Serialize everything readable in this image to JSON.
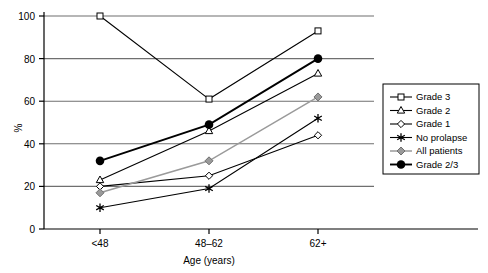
{
  "chart_data": {
    "type": "line",
    "title": "",
    "xlabel": "Age  (years)",
    "ylabel": "%",
    "categories": [
      "<48",
      "48–62",
      "62+"
    ],
    "ylim": [
      0,
      100
    ],
    "yticks": [
      0,
      20,
      40,
      60,
      80,
      100
    ],
    "grid": true,
    "legend_position": "right",
    "series": [
      {
        "name": "Grade 3",
        "values": [
          100,
          61,
          93
        ],
        "marker": "open-square",
        "color": "#000000",
        "marker_fill": "#ffffff"
      },
      {
        "name": "Grade 2",
        "values": [
          23,
          46,
          73
        ],
        "marker": "open-triangle",
        "color": "#000000",
        "marker_fill": "#ffffff"
      },
      {
        "name": "Grade 1",
        "values": [
          20,
          25,
          44
        ],
        "marker": "open-diamond",
        "color": "#000000",
        "marker_fill": "#ffffff"
      },
      {
        "name": "No prolapse",
        "values": [
          10,
          19,
          52
        ],
        "marker": "star",
        "color": "#000000",
        "marker_fill": "#000000"
      },
      {
        "name": "All patients",
        "values": [
          17,
          32,
          62
        ],
        "marker": "gray-diamond",
        "color": "#9a9a9a",
        "marker_fill": "#9a9a9a"
      },
      {
        "name": "Grade 2/3",
        "values": [
          32,
          49,
          80
        ],
        "marker": "filled-circle",
        "color": "#000000",
        "marker_fill": "#000000"
      }
    ]
  },
  "axes": {
    "y_tick_labels": [
      "0",
      "20",
      "40",
      "60",
      "80",
      "100"
    ],
    "x_tick_labels": [
      "<48",
      "48–62",
      "62+"
    ],
    "y_axis_label": "%",
    "x_axis_label": "Age  (years)"
  },
  "legend": {
    "items": [
      {
        "label": "Grade 3"
      },
      {
        "label": "Grade 2"
      },
      {
        "label": "Grade 1"
      },
      {
        "label": "No prolapse"
      },
      {
        "label": "All patients"
      },
      {
        "label": "Grade 2/3"
      }
    ]
  },
  "colors": {
    "axis": "#000000",
    "grid": "#6f6f6f",
    "gray_series": "#9a9a9a",
    "background": "#ffffff"
  }
}
